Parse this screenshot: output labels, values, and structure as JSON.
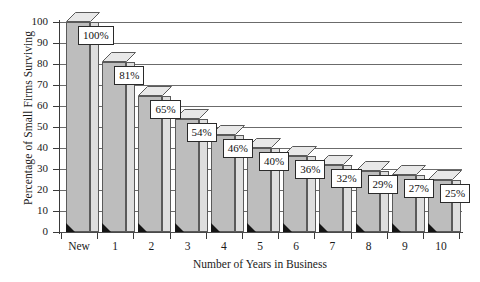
{
  "chart_data": {
    "type": "bar",
    "title": "",
    "xlabel": "Number of Years in Business",
    "ylabel": "Percentage of Small Firms Surviving",
    "categories": [
      "New",
      "1",
      "2",
      "3",
      "4",
      "5",
      "6",
      "7",
      "8",
      "9",
      "10"
    ],
    "values": [
      100,
      81,
      65,
      54,
      46,
      40,
      36,
      32,
      29,
      27,
      25
    ],
    "data_labels": [
      "100%",
      "81%",
      "65%",
      "54%",
      "46%",
      "40%",
      "36%",
      "32%",
      "29%",
      "27%",
      "25%"
    ],
    "ylim": [
      0,
      100
    ],
    "ytick_labels": [
      "0",
      "10",
      "20",
      "30",
      "40",
      "50",
      "60",
      "70",
      "80",
      "90",
      "100"
    ],
    "ytick_values": [
      0,
      10,
      20,
      30,
      40,
      50,
      60,
      70,
      80,
      90,
      100
    ],
    "grid": true,
    "grid_axis": "y",
    "legend": "none",
    "style": "3d-bars",
    "colors": {
      "bar_front": "#bdbdbd",
      "bar_side": "#dedede",
      "bar_top": "#e8e8e8",
      "bar_outline": "#5a5a5a",
      "gridline": "#6b6b6b",
      "axis": "#3a3a3a",
      "label_box_fill": "#ffffff",
      "label_box_border": "#2a2a2a",
      "text": "#1a1a1a",
      "background": "#ffffff"
    }
  }
}
